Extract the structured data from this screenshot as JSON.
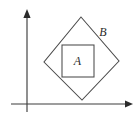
{
  "figure": {
    "canvas": {
      "width": 139,
      "height": 119,
      "background_color": "#ffffff"
    },
    "stroke_color": "#4a4a4a",
    "axis_color": "#3d3d3d",
    "label_color": "#2b2b2b",
    "axes": {
      "x_axis": {
        "name": "horizontal-axis",
        "y": 104,
        "x_start": 11,
        "x_end": 133,
        "arrow_at": "end"
      },
      "y_axis": {
        "name": "vertical-axis",
        "x": 27,
        "y_start": 112,
        "y_end": 9,
        "arrow_at": "top"
      }
    },
    "shapes": [
      {
        "id": "outer-diamond",
        "label": "B",
        "type": "rotated-square",
        "points": "81,17 119,61 82,100 44,62",
        "label_x": 103,
        "label_y": 33
      },
      {
        "id": "inner-square",
        "label": "A",
        "type": "square",
        "x": 62,
        "y": 45,
        "width": 32,
        "height": 32,
        "label_x": 77.5,
        "label_y": 61.5
      }
    ]
  }
}
